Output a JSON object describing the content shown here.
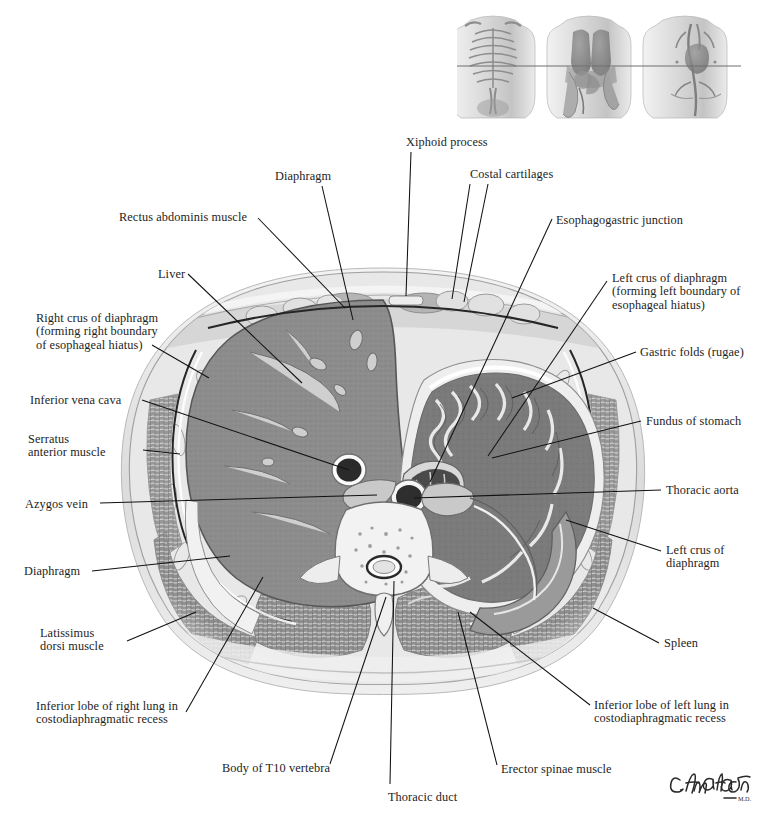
{
  "plate": {
    "title": "Cross Section of the Thorax at T10 Vertebral Level",
    "artist_signature": "C. Machado",
    "artist_credential": "M.D.",
    "background_color": "#ffffff",
    "text_color": "#1d1d1d",
    "leader_color": "#111111"
  },
  "orientation_thumbnails": {
    "count": 3,
    "section_line": true,
    "views": [
      {
        "name": "skeleton-thorax-view",
        "caption": ""
      },
      {
        "name": "lungs-and-viscera-view",
        "caption": ""
      },
      {
        "name": "heart-and-great-vessels-view",
        "caption": ""
      }
    ]
  },
  "labels": [
    {
      "id": "xiphoid-process",
      "text": "Xiphoid process",
      "x": 406,
      "y": 136,
      "align": "left",
      "lines": 1
    },
    {
      "id": "diaphragm-top",
      "text": "Diaphragm",
      "x": 275,
      "y": 170,
      "align": "left",
      "lines": 1
    },
    {
      "id": "costal-cartilages",
      "text": "Costal cartilages",
      "x": 470,
      "y": 168,
      "align": "left",
      "lines": 1
    },
    {
      "id": "rectus-abdominis-muscle",
      "text": "Rectus abdominis muscle",
      "x": 119,
      "y": 211,
      "align": "left",
      "lines": 1
    },
    {
      "id": "esophagogastric-junction",
      "text": "Esophagogastric junction",
      "x": 556,
      "y": 214,
      "align": "left",
      "lines": 1
    },
    {
      "id": "liver",
      "text": "Liver",
      "x": 158,
      "y": 268,
      "align": "left",
      "lines": 1
    },
    {
      "id": "left-crus-upper",
      "text": "Left crus of diaphragm\n(forming left boundary of\nesophageal hiatus)",
      "x": 612,
      "y": 272,
      "align": "left",
      "lines": 3
    },
    {
      "id": "right-crus",
      "text": "Right crus of diaphragm\n(forming right boundary\nof esophageal hiatus)",
      "x": 36,
      "y": 312,
      "align": "left",
      "lines": 3
    },
    {
      "id": "gastric-folds-rugae",
      "text": "Gastric folds (rugae)",
      "x": 640,
      "y": 346,
      "align": "left",
      "lines": 1
    },
    {
      "id": "inferior-vena-cava",
      "text": "Inferior vena cava",
      "x": 30,
      "y": 394,
      "align": "left",
      "lines": 1
    },
    {
      "id": "fundus-of-stomach",
      "text": "Fundus of stomach",
      "x": 646,
      "y": 415,
      "align": "left",
      "lines": 1
    },
    {
      "id": "serratus-anterior-muscle",
      "text": "Serratus\nanterior muscle",
      "x": 28,
      "y": 433,
      "align": "left",
      "lines": 2
    },
    {
      "id": "azygos-vein",
      "text": "Azygos vein",
      "x": 25,
      "y": 498,
      "align": "left",
      "lines": 1
    },
    {
      "id": "thoracic-aorta",
      "text": "Thoracic aorta",
      "x": 666,
      "y": 484,
      "align": "left",
      "lines": 1
    },
    {
      "id": "left-crus-lower",
      "text": "Left crus of\ndiaphragm",
      "x": 666,
      "y": 544,
      "align": "left",
      "lines": 2
    },
    {
      "id": "diaphragm-left",
      "text": "Diaphragm",
      "x": 24,
      "y": 565,
      "align": "left",
      "lines": 1
    },
    {
      "id": "latissimus-dorsi-muscle",
      "text": "Latissimus\ndorsi muscle",
      "x": 40,
      "y": 627,
      "align": "left",
      "lines": 2
    },
    {
      "id": "spleen",
      "text": "Spleen",
      "x": 664,
      "y": 637,
      "align": "left",
      "lines": 1
    },
    {
      "id": "inferior-lobe-right-lung",
      "text": "Inferior lobe of right lung in\ncostodiaphragmatic recess",
      "x": 36,
      "y": 700,
      "align": "left",
      "lines": 2
    },
    {
      "id": "inferior-lobe-left-lung",
      "text": "Inferior lobe of left lung in\ncostodiaphragmatic recess",
      "x": 594,
      "y": 699,
      "align": "left",
      "lines": 2
    },
    {
      "id": "body-of-t10-vertebra",
      "text": "Body of T10 vertebra",
      "x": 222,
      "y": 762,
      "align": "left",
      "lines": 1
    },
    {
      "id": "erector-spinae-muscle",
      "text": "Erector spinae muscle",
      "x": 501,
      "y": 763,
      "align": "left",
      "lines": 1
    },
    {
      "id": "thoracic-duct",
      "text": "Thoracic duct",
      "x": 388,
      "y": 791,
      "align": "left",
      "lines": 1
    }
  ],
  "leaders": [
    {
      "id": "leader-xiphoid-process",
      "points": "411,152 406,296"
    },
    {
      "id": "leader-diaphragm-top",
      "points": "322,186 353,320"
    },
    {
      "id": "leader-costal-cartilages-a",
      "points": "470,184 452,299"
    },
    {
      "id": "leader-costal-cartilages-b",
      "points": "488,184 464,302"
    },
    {
      "id": "leader-rectus-abdominis",
      "points": "258,218 345,308"
    },
    {
      "id": "leader-esophagogastric-junction",
      "points": "552,219 430,482"
    },
    {
      "id": "leader-liver",
      "points": "188,274 302,383"
    },
    {
      "id": "leader-left-crus-upper",
      "points": "607,281 488,456"
    },
    {
      "id": "leader-right-crus",
      "points": "152,345 209,378"
    },
    {
      "id": "leader-gastric-folds",
      "points": "636,352 512,398"
    },
    {
      "id": "leader-inferior-vena-cava",
      "points": "142,400 349,470"
    },
    {
      "id": "leader-fundus-of-stomach",
      "points": "641,421 492,458"
    },
    {
      "id": "leader-serratus-anterior",
      "points": "143,450 180,454"
    },
    {
      "id": "leader-azygos-vein",
      "points": "100,503 377,495"
    },
    {
      "id": "leader-thoracic-aorta",
      "points": "661,490 414,498"
    },
    {
      "id": "leader-left-crus-lower",
      "points": "661,551 566,520"
    },
    {
      "id": "leader-diaphragm-left",
      "points": "92,571 230,556"
    },
    {
      "id": "leader-latissimus-dorsi",
      "points": "127,641 196,612"
    },
    {
      "id": "leader-spleen",
      "points": "659,643 593,608"
    },
    {
      "id": "leader-inf-lobe-right-lung",
      "points": "186,712 263,577"
    },
    {
      "id": "leader-inf-lobe-left-lung",
      "points": "590,705 470,612"
    },
    {
      "id": "leader-body-of-t10",
      "points": "330,764 386,597"
    },
    {
      "id": "leader-erector-spinae",
      "points": "497,765 458,612"
    },
    {
      "id": "leader-thoracic-duct",
      "points": "390,784 394,581"
    }
  ]
}
